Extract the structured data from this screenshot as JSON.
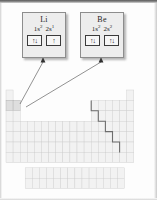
{
  "figure": {
    "background_color": "#fdfdfd"
  },
  "callouts": [
    {
      "id": "lithium",
      "symbol": "Li",
      "config_terms": [
        {
          "orbital": "1s",
          "electrons": "2"
        },
        {
          "orbital": "2s",
          "electrons": "1"
        }
      ],
      "orbital_boxes": [
        "↑↓",
        "↑"
      ],
      "pointer_target": "period-2-group-1"
    },
    {
      "id": "beryllium",
      "symbol": "Be",
      "config_terms": [
        {
          "orbital": "1s",
          "electrons": "2"
        },
        {
          "orbital": "2s",
          "electrons": "2"
        }
      ],
      "orbital_boxes": [
        "↑↓",
        "↑↓"
      ],
      "pointer_target": "period-2-group-2"
    }
  ],
  "periodic_table": {
    "cell_fill": "#f2f2f2",
    "cell_border": "#cdcdcd",
    "highlight_fill": "#dedede",
    "staircase_color": "#6e6e6e",
    "highlighted_cells": [
      "period-2-group-1",
      "period-2-group-2"
    ],
    "row_count": 7,
    "fblock_row_count": 2,
    "has_metalloid_staircase": true
  },
  "leader_lines": {
    "color": "#4a4a4a",
    "arrowheads": 2
  }
}
